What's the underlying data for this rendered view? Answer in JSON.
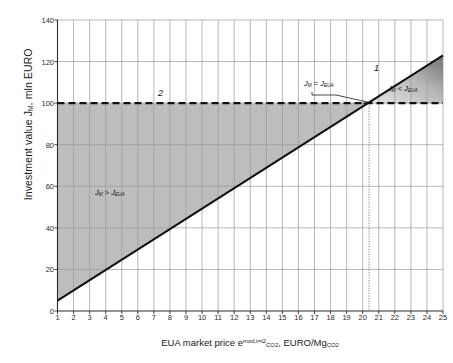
{
  "chart_data": {
    "type": "line",
    "title": "",
    "xlabel": "EUA market price e",
    "xlabel_sup": "mod,t=t2",
    "xlabel_sub": "CO2",
    "xlabel_tail": ", EURO/Mg",
    "xlabel_tail_sub": "CO2",
    "ylabel": "Investment value J",
    "ylabel_sub": "M",
    "ylabel_tail": ", mln EURO",
    "xlim": [
      1,
      25
    ],
    "ylim": [
      0,
      140
    ],
    "xticks": [
      1,
      2,
      3,
      4,
      5,
      6,
      7,
      8,
      9,
      10,
      11,
      12,
      13,
      14,
      15,
      16,
      17,
      18,
      19,
      20,
      21,
      22,
      23,
      24,
      25
    ],
    "yticks": [
      0,
      20,
      40,
      60,
      80,
      100,
      120,
      140
    ],
    "grid": true,
    "legend": "none",
    "series": [
      {
        "name": "1",
        "label": "1",
        "type": "line",
        "style": "solid",
        "x": [
          1,
          25
        ],
        "values": [
          5,
          123
        ]
      },
      {
        "name": "2",
        "label": "2",
        "type": "line",
        "style": "dashed",
        "x": [
          1,
          25
        ],
        "values": [
          100,
          100
        ]
      }
    ],
    "intersection": {
      "x": 20.4,
      "y": 100
    },
    "annotations": [
      {
        "name": "equality-callout",
        "text": "J_M = J_EUA",
        "lhs": "J",
        "lhs_sub": "M",
        "op": "=",
        "rhs": "J",
        "rhs_sub": "EUA"
      },
      {
        "name": "greater-region",
        "text": "J_M > J_EUA",
        "lhs": "J",
        "lhs_sub": "M",
        "op": ">",
        "rhs": "J",
        "rhs_sub": "EUA"
      },
      {
        "name": "less-region",
        "text": "J_M < J_EUA",
        "lhs": "J",
        "lhs_sub": "M",
        "op": "<",
        "rhs": "J",
        "rhs_sub": "EUA"
      },
      {
        "name": "series-1-label",
        "text": "1"
      },
      {
        "name": "series-2-label",
        "text": "2"
      }
    ],
    "colors": {
      "line": "#101010",
      "grid": "#9a9a9a",
      "axis": "#2b2b2b",
      "fill_lower": "#bdbdbd",
      "fill_upper_light": "#e6e6e6",
      "fill_upper_dark": "#6f6f6f",
      "background": "#ffffff"
    }
  }
}
